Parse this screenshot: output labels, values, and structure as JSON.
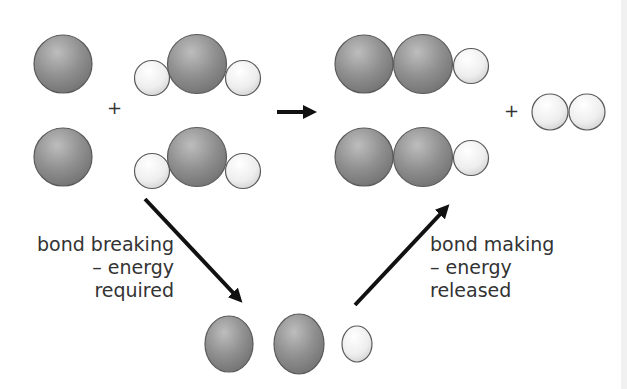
{
  "diagram": {
    "type": "reaction mechanism",
    "plus_signs": [
      "+",
      "+"
    ],
    "labels": {
      "breaking": {
        "line1": "bond breaking",
        "line2": "– energy",
        "line3": "required"
      },
      "making": {
        "line1": "bond making",
        "line2": "– energy",
        "line3": "released"
      }
    },
    "colors": {
      "large_atom": "#8e8e8e",
      "small_atom": "#f2f2f2",
      "outline": "#5a5a5a",
      "arrow": "#111111",
      "text": "#333333"
    },
    "reactants": [
      "single large atom",
      "triatomic molecule (small-large-small)",
      "single large atom",
      "triatomic molecule (small-large-small)"
    ],
    "products": [
      "triatomic (large-large-small)",
      "triatomic (large-large-small)",
      "diatomic (small-small)"
    ],
    "intermediate": [
      "large atom",
      "large atom",
      "small atom"
    ]
  }
}
